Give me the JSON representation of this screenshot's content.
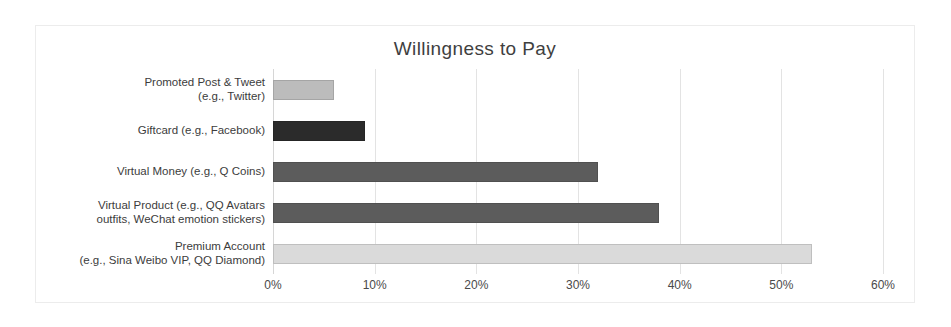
{
  "chart_data": {
    "type": "bar",
    "orientation": "horizontal",
    "title": "Willingness to Pay",
    "xlabel": "",
    "ylabel": "",
    "xlim": [
      0,
      60
    ],
    "xtick_labels": [
      "0%",
      "10%",
      "20%",
      "30%",
      "40%",
      "50%",
      "60%"
    ],
    "xticks": [
      0,
      10,
      20,
      30,
      40,
      50,
      60
    ],
    "grid": true,
    "legend": null,
    "unit": "%",
    "categories": [
      "Promoted Post & Tweet\n(e.g., Twitter)",
      "Giftcard (e.g., Facebook)",
      "Virtual Money (e.g., Q Coins)",
      "Virtual Product (e.g., QQ Avatars\noutfits, WeChat emotion stickers)",
      "Premium Account\n(e.g., Sina Weibo VIP, QQ Diamond)"
    ],
    "values": [
      6,
      9,
      32,
      38,
      53
    ],
    "bar_colors": [
      "#bcbcbc",
      "#2b2b2b",
      "#5c5c5c",
      "#5c5c5c",
      "#dadada"
    ]
  },
  "frame": {
    "border_color": "#ececec",
    "background": "#ffffff"
  }
}
